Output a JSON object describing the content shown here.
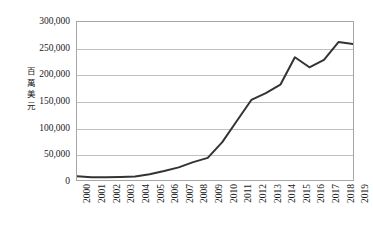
{
  "chart_data": {
    "type": "line",
    "title": "",
    "xlabel": "",
    "ylabel": "百萬美元",
    "categories": [
      "2000",
      "2001",
      "2002",
      "2003",
      "2004",
      "2005",
      "2006",
      "2007",
      "2008",
      "2009",
      "2010",
      "2011",
      "2012",
      "2013",
      "2014",
      "2015",
      "2016",
      "2017",
      "2018",
      "2019"
    ],
    "values": [
      7000,
      5000,
      5000,
      5500,
      6500,
      11000,
      17000,
      24000,
      34000,
      42000,
      72000,
      112000,
      152000,
      165000,
      181000,
      233000,
      214000,
      228000,
      262000,
      258000
    ],
    "series": [
      {
        "name": "",
        "values": [
          7000,
          5000,
          5000,
          5500,
          6500,
          11000,
          17000,
          24000,
          34000,
          42000,
          72000,
          112000,
          152000,
          165000,
          181000,
          233000,
          214000,
          228000,
          262000,
          258000
        ]
      }
    ],
    "ylim": [
      0,
      300000
    ],
    "yticks": [
      0,
      50000,
      100000,
      150000,
      200000,
      250000,
      300000
    ],
    "ytick_labels": [
      "0",
      "50,000",
      "100,000",
      "150,000",
      "200,000",
      "250,000",
      "300,000"
    ],
    "grid": true,
    "grid_axis": "y",
    "legend": false,
    "legend_position": "none",
    "line_color": "#333333",
    "line_width": 2,
    "plot_border_color": "#a6a6a6",
    "grid_color": "#bfbfbf",
    "background_color": "#ffffff",
    "text_color": "#1a1a1a"
  },
  "axis": {
    "y_title_chars": [
      "百",
      "萬",
      "美",
      "元"
    ]
  }
}
